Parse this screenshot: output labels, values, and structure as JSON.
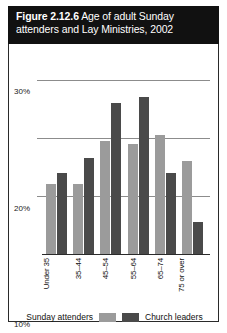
{
  "title": {
    "figure_label": "Figure 2.12.6",
    "text": " Age of adult Sunday attenders and Lay Ministries, 2002"
  },
  "chart_data": {
    "type": "bar",
    "title": "Figure 2.12.6 Age of adult Sunday attenders and Lay Ministries, 2002",
    "categories": [
      "Under 35",
      "35–44",
      "45–54",
      "55–64",
      "65–74",
      "75 or over"
    ],
    "series": [
      {
        "name": "Sunday attenders",
        "color": "#9b9b9b",
        "values": [
          12,
          12,
          19.5,
          19,
          20.5,
          16
        ]
      },
      {
        "name": "Church leaders",
        "color": "#4a4a4a",
        "values": [
          14,
          16.5,
          26,
          27,
          14,
          5.5
        ]
      }
    ],
    "xlabel": "",
    "ylabel": "",
    "ylim": [
      0,
      32
    ],
    "yticks": [
      10,
      20,
      30
    ],
    "ytick_labels": [
      "10%",
      "20%",
      "30%"
    ],
    "grid": true,
    "legend_position": "bottom"
  },
  "legend": {
    "light_label": "Sunday attenders",
    "dark_label": "Church leaders"
  }
}
